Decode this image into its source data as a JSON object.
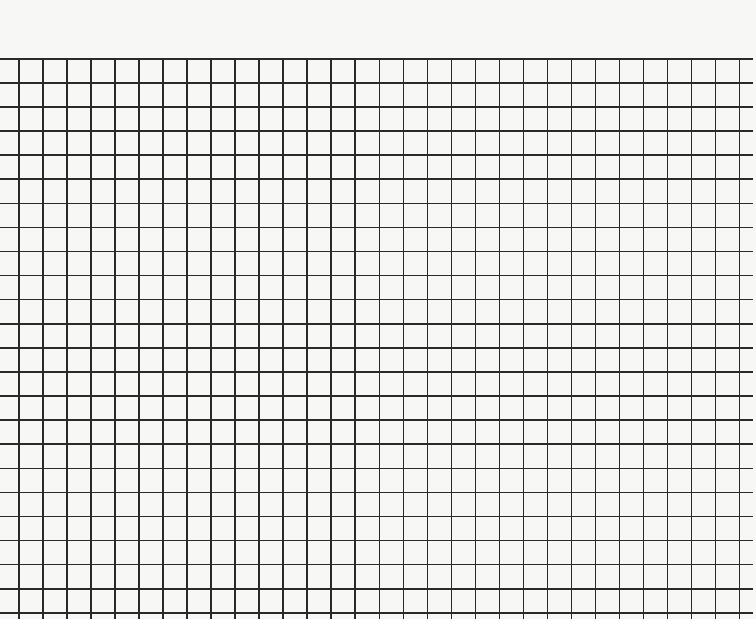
{
  "sheet": {
    "type": "graph paper",
    "background_color": "#f7f7f6",
    "line_color": "#2a2a2a",
    "grid": {
      "top": 58,
      "bottom": 619,
      "left": 18,
      "right": 739,
      "h_line_left": 0,
      "h_line_right": 753,
      "cell_width": 24.03,
      "cell_height": 24.09,
      "vertical_lines": 31,
      "horizontal_lines": 24
    }
  }
}
